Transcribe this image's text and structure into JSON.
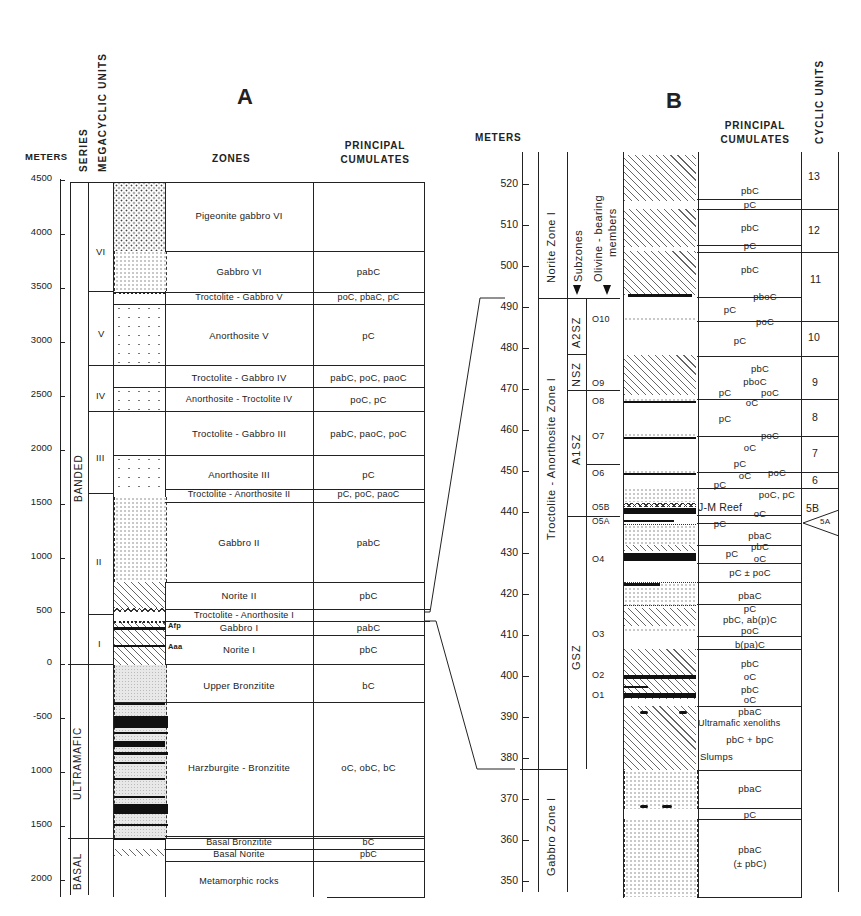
{
  "panel_a": {
    "label": "A",
    "headers": {
      "meters": "METERS",
      "series": "SERIES",
      "megacyclic_units": "MEGACYCLIC UNITS",
      "zones": "ZONES",
      "principal_cumulates_1": "PRINCIPAL",
      "principal_cumulates_2": "CUMULATES"
    },
    "ticks": [
      "4500",
      "4000",
      "3500",
      "3000",
      "2500",
      "2000",
      "1500",
      "1000",
      "500",
      "0",
      "-500",
      "1000",
      "1500",
      "2000"
    ],
    "series": [
      "BANDED",
      "ULTRAMAFIC",
      "BASAL"
    ],
    "megacyclic_units": [
      "VI",
      "V",
      "IV",
      "III",
      "II",
      "I"
    ],
    "zones": [
      {
        "name": "Pigeonite gabbro VI",
        "cumulates": ""
      },
      {
        "name": "Gabbro VI",
        "cumulates": "pabC"
      },
      {
        "name": "Troctolite - Gabbro V",
        "cumulates": "poC, pbaC, pC"
      },
      {
        "name": "Anorthosite V",
        "cumulates": "pC"
      },
      {
        "name": "Troctolite - Gabbro IV",
        "cumulates": "pabC, poC, paoC"
      },
      {
        "name": "Anorthosite - Troctolite IV",
        "cumulates": "poC, pC"
      },
      {
        "name": "Troctolite - Gabbro III",
        "cumulates": "pabC, paoC, poC"
      },
      {
        "name": "Anorthosite III",
        "cumulates": "pC"
      },
      {
        "name": "Troctolite - Anorthosite II",
        "cumulates": "pC, poC, paoC"
      },
      {
        "name": "Gabbro II",
        "cumulates": "pabC"
      },
      {
        "name": "Norite II",
        "cumulates": "pbC"
      },
      {
        "name": "Troctolite - Anorthosite I",
        "cumulates": ""
      },
      {
        "name": "Gabbro I",
        "cumulates": "pabC"
      },
      {
        "name": "Norite I",
        "cumulates": "pbC"
      },
      {
        "name": "Upper Bronzitite",
        "cumulates": "bC"
      },
      {
        "name": "Harzburgite - Bronzitite",
        "cumulates": "oC, obC, bC"
      },
      {
        "name": "Basal Bronzitite",
        "cumulates": "bC"
      },
      {
        "name": "Basal Norite",
        "cumulates": "pbC"
      },
      {
        "name": "Metamorphic rocks",
        "cumulates": ""
      }
    ],
    "markers": {
      "afp": "Afp",
      "aaa": "Aaa"
    }
  },
  "panel_b": {
    "label": "B",
    "headers": {
      "meters": "METERS",
      "principal_cumulates_1": "PRINCIPAL",
      "principal_cumulates_2": "CUMULATES",
      "cyclic_units": "CYCLIC UNITS",
      "subzones": "Subzones",
      "olivine_1": "Olivine - bearing",
      "olivine_2": "members"
    },
    "ticks": [
      "520",
      "510",
      "500",
      "490",
      "480",
      "470",
      "460",
      "450",
      "440",
      "430",
      "420",
      "410",
      "400",
      "390",
      "380",
      "370",
      "360",
      "350"
    ],
    "zones": [
      "Norite Zone I",
      "Troctolite - Anorthosite Zone I",
      "Gabbro Zone I"
    ],
    "subzones": [
      "A2SZ",
      "NSZ",
      "A1SZ",
      "GSZ"
    ],
    "olivine_members": [
      "O10",
      "O9",
      "O8",
      "O7",
      "O6",
      "O5B",
      "O5A",
      "O4",
      "O3",
      "O2",
      "O1"
    ],
    "cyclic_units": [
      "13",
      "12",
      "11",
      "10",
      "9",
      "8",
      "7",
      "6",
      "5B",
      "5A"
    ],
    "cumulates": [
      {
        "text": "pbC",
        "y": 185
      },
      {
        "text": "pC",
        "y": 204
      },
      {
        "text": "pbC",
        "y": 227
      },
      {
        "text": "pC",
        "y": 246
      },
      {
        "text": "pbC",
        "y": 269
      },
      {
        "text": "pboC",
        "y": 296
      },
      {
        "text": "pC",
        "y": 307
      },
      {
        "text": "poC",
        "y": 320
      },
      {
        "text": "pC",
        "y": 341
      },
      {
        "text": "pbC",
        "y": 368
      },
      {
        "text": "pboC",
        "y": 380
      },
      {
        "text": "pC",
        "y": 392
      },
      {
        "text": "poC",
        "y": 392
      },
      {
        "text": "oC",
        "y": 402
      },
      {
        "text": "pC",
        "y": 417
      },
      {
        "text": "poC",
        "y": 434
      },
      {
        "text": "oC",
        "y": 446
      },
      {
        "text": "pC",
        "y": 461
      },
      {
        "text": "oC",
        "y": 475
      },
      {
        "text": "poC",
        "y": 473
      },
      {
        "text": "pC",
        "y": 482
      },
      {
        "text": "poC, pC",
        "y": 494
      },
      {
        "text": "J-M Reef",
        "y": 505
      },
      {
        "text": "oC",
        "y": 513
      },
      {
        "text": "pC",
        "y": 522
      },
      {
        "text": "pbaC",
        "y": 536
      },
      {
        "text": "pC",
        "y": 551
      },
      {
        "text": "pbC",
        "y": 548
      },
      {
        "text": "oC",
        "y": 561
      },
      {
        "text": "pC ± poC",
        "y": 573
      },
      {
        "text": "pbaC",
        "y": 596
      },
      {
        "text": "pC",
        "y": 609
      },
      {
        "text": "pbC, ab(p)C",
        "y": 619
      },
      {
        "text": "poC",
        "y": 630
      },
      {
        "text": "b(pa)C",
        "y": 645
      },
      {
        "text": "pbC",
        "y": 665
      },
      {
        "text": "oC",
        "y": 678
      },
      {
        "text": "pbC",
        "y": 691
      },
      {
        "text": "oC",
        "y": 700
      },
      {
        "text": "pbaC",
        "y": 712
      },
      {
        "text": "Ultramafic xenoliths",
        "y": 724
      },
      {
        "text": "pbC + bpC",
        "y": 740
      },
      {
        "text": "Slumps",
        "y": 757
      },
      {
        "text": "pbaC",
        "y": 789
      },
      {
        "text": "pC",
        "y": 815
      },
      {
        "text": "pbaC",
        "y": 850
      },
      {
        "text": "(± pbC)",
        "y": 864
      }
    ]
  }
}
